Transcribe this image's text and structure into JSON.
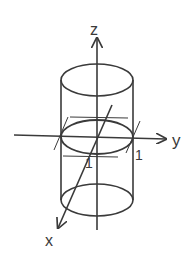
{
  "diagram": {
    "type": "3d-cylinder-axes",
    "axes": {
      "x": {
        "label": "x"
      },
      "y": {
        "label": "y"
      },
      "z": {
        "label": "z"
      }
    },
    "unit_labels": {
      "y_tick": "1",
      "x_tick": "1"
    },
    "colors": {
      "stroke": "#3a3a3a",
      "background": "#ffffff"
    }
  }
}
